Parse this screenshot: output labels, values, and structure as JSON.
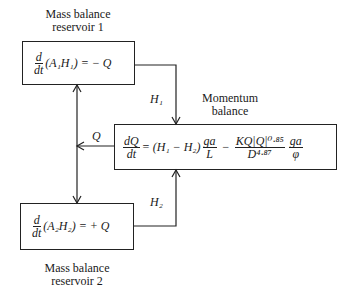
{
  "labels": {
    "reservoir1_title_line1": "Mass balance",
    "reservoir1_title_line2": "reservoir 1",
    "reservoir2_title_line1": "Mass balance",
    "reservoir2_title_line2": "reservoir 2",
    "momentum_title_line1": "Momentum",
    "momentum_title_line2": "balance"
  },
  "equations": {
    "reservoir1": {
      "d": "d",
      "dt": "dt",
      "body": "(A₁H₁) = − Q"
    },
    "reservoir2": {
      "d": "d",
      "dt": "dt",
      "body": "(A₂H₂) = + Q"
    },
    "momentum": {
      "lhs_num": "dQ",
      "lhs_den": "dt",
      "eq_head": "= (H₁ − H₂)",
      "frac1_num": "ga",
      "frac1_den": "L",
      "minus": "−",
      "frac2_num": "KQ|Q|⁰·⁸⁵",
      "frac2_den": "D⁴·⁸⁷",
      "frac3_num": "ga",
      "frac3_den": "φ"
    }
  },
  "signals": {
    "h1": "H₁",
    "h2": "H₂",
    "q": "Q"
  }
}
